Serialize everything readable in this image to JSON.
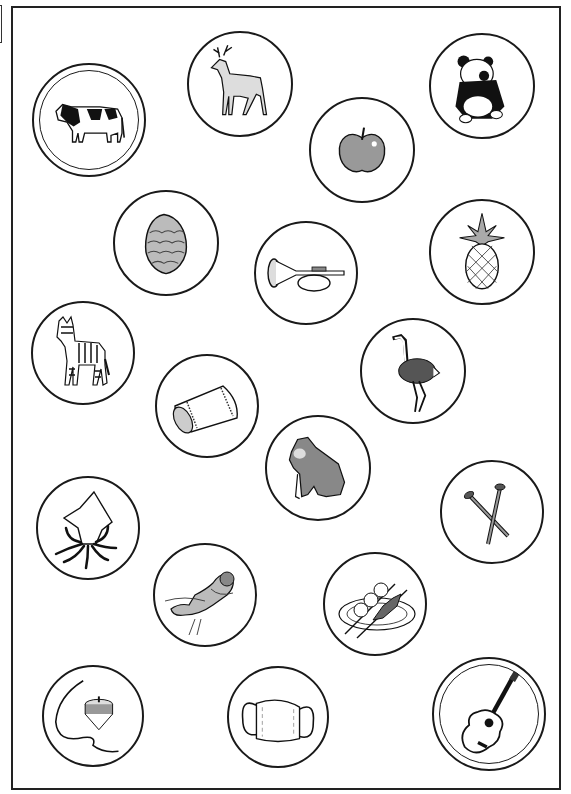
{
  "sheet": {
    "type": "picture-card worksheet",
    "frame_color": "#222222",
    "cards": [
      {
        "id": "cow",
        "label": "cow",
        "cx": 89,
        "cy": 120,
        "r": 57,
        "double": true
      },
      {
        "id": "deer",
        "label": "deer",
        "cx": 240,
        "cy": 84,
        "r": 53,
        "double": false
      },
      {
        "id": "panda",
        "label": "panda",
        "cx": 482,
        "cy": 86,
        "r": 53,
        "double": false
      },
      {
        "id": "apple",
        "label": "apple",
        "cx": 362,
        "cy": 150,
        "r": 53,
        "double": false
      },
      {
        "id": "pinecone",
        "label": "pine cone",
        "cx": 166,
        "cy": 243,
        "r": 53,
        "double": false
      },
      {
        "id": "trumpet",
        "label": "bugle",
        "cx": 306,
        "cy": 273,
        "r": 52,
        "double": false
      },
      {
        "id": "pineapple",
        "label": "pineapple",
        "cx": 482,
        "cy": 252,
        "r": 53,
        "double": false
      },
      {
        "id": "zebra",
        "label": "zebra",
        "cx": 83,
        "cy": 353,
        "r": 52,
        "double": false
      },
      {
        "id": "ostrich",
        "label": "ostrich",
        "cx": 413,
        "cy": 371,
        "r": 53,
        "double": false
      },
      {
        "id": "pillow",
        "label": "pillow",
        "cx": 207,
        "cy": 406,
        "r": 52,
        "double": false
      },
      {
        "id": "gorilla",
        "label": "gorilla",
        "cx": 318,
        "cy": 468,
        "r": 53,
        "double": false
      },
      {
        "id": "needles",
        "label": "knitting needles",
        "cx": 492,
        "cy": 512,
        "r": 52,
        "double": false
      },
      {
        "id": "squid",
        "label": "squid",
        "cx": 88,
        "cy": 528,
        "r": 52,
        "double": false
      },
      {
        "id": "otter",
        "label": "sea otter",
        "cx": 205,
        "cy": 595,
        "r": 52,
        "double": false
      },
      {
        "id": "dango",
        "label": "dango",
        "cx": 375,
        "cy": 604,
        "r": 52,
        "double": false
      },
      {
        "id": "top",
        "label": "spinning top",
        "cx": 93,
        "cy": 716,
        "r": 51,
        "double": false
      },
      {
        "id": "mask",
        "label": "mask",
        "cx": 278,
        "cy": 717,
        "r": 51,
        "double": false
      },
      {
        "id": "guitar",
        "label": "guitar",
        "cx": 489,
        "cy": 714,
        "r": 57,
        "double": true
      }
    ]
  }
}
